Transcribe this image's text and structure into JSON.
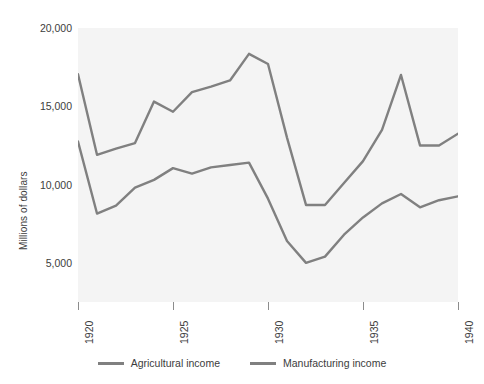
{
  "chart_data": {
    "type": "line",
    "title": "",
    "xlabel": "",
    "ylabel": "Millions of dollars",
    "xlim": [
      1920,
      1940
    ],
    "ylim": [
      2500,
      20000
    ],
    "grid": false,
    "legend_position": "bottom",
    "plot_background": "#f4f4f4",
    "line_color": "#808080",
    "x": [
      1920,
      1921,
      1922,
      1923,
      1924,
      1925,
      1926,
      1927,
      1928,
      1929,
      1930,
      1931,
      1932,
      1933,
      1934,
      1935,
      1936,
      1937,
      1938,
      1939,
      1940
    ],
    "y_ticks": [
      5000,
      10000,
      15000,
      20000
    ],
    "y_tick_labels": [
      "5,000",
      "10,000",
      "15,000",
      "20,000"
    ],
    "x_ticks": [
      1920,
      1925,
      1930,
      1935,
      1940
    ],
    "x_tick_labels": [
      "1920",
      "1925",
      "1930",
      "1935",
      "1940"
    ],
    "series": [
      {
        "name": "Agricultural income",
        "color": "#808080",
        "values": [
          12750,
          8150,
          8650,
          9800,
          10300,
          11050,
          10700,
          11100,
          11250,
          11400,
          9100,
          6400,
          5000,
          5400,
          6800,
          7900,
          8800,
          9400,
          8550,
          9000,
          9250
        ]
      },
      {
        "name": "Manufacturing income",
        "color": "#808080",
        "values": [
          17050,
          11900,
          12300,
          12650,
          15300,
          14650,
          15900,
          16250,
          16650,
          18350,
          17700,
          13000,
          8700,
          8700,
          10100,
          11500,
          13500,
          17000,
          12500,
          12500,
          13250
        ]
      }
    ]
  },
  "axes": {
    "y_title": "Millions of dollars"
  },
  "legend": {
    "items": [
      {
        "label": "Agricultural income",
        "color": "#808080"
      },
      {
        "label": "Manufacturing income",
        "color": "#808080"
      }
    ]
  }
}
